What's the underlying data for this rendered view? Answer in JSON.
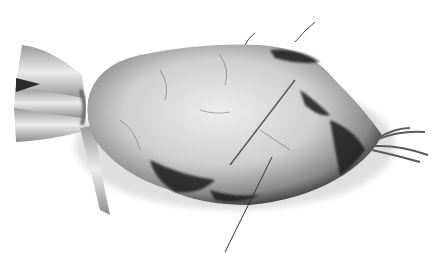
{
  "image": {
    "subject": "sugar beet root",
    "style": "grayscale photograph",
    "background": "#ffffff",
    "annotation": {
      "type": "leader-line",
      "label": ""
    },
    "colors": {
      "body_light": "#d9d9d9",
      "body_mid": "#a8a8a8",
      "soil_dark": "#2a2a2a",
      "stalk_light": "#e6e6e6",
      "stalk_shade": "#8c8c8c",
      "leader_line": "#333333"
    }
  }
}
